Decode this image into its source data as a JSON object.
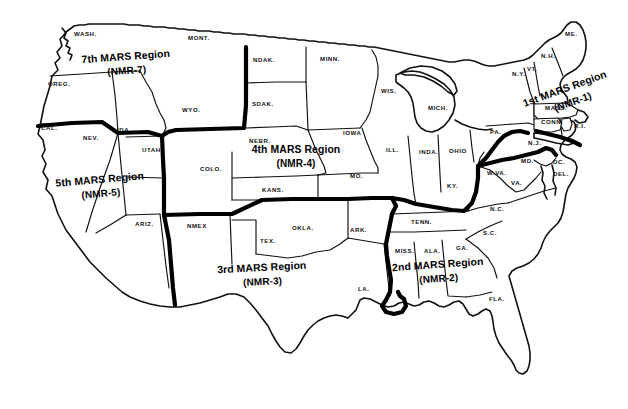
{
  "map": {
    "title": "MARS Region Map of the Continental United States",
    "background_color": "#ffffff",
    "line_color": "#111111",
    "region_boundary_color": "#000000",
    "regions": [
      {
        "id": "nmr-7",
        "name": "7th MARS Region",
        "code": "(NMR-7)",
        "label_x": 126,
        "label_y": 60,
        "sub_x": 126,
        "sub_y": 74
      },
      {
        "id": "nmr-5",
        "name": "5th MARS Region",
        "code": "(NMR-5)",
        "label_x": 100,
        "label_y": 183,
        "sub_x": 100,
        "sub_y": 197
      },
      {
        "id": "nmr-4",
        "name": "4th MARS Region",
        "code": "(NMR-4)",
        "label_x": 296,
        "label_y": 153,
        "sub_x": 296,
        "sub_y": 167
      },
      {
        "id": "nmr-3",
        "name": "3rd MARS Region",
        "code": "(NMR-3)",
        "label_x": 262,
        "label_y": 271,
        "sub_x": 262,
        "sub_y": 285
      },
      {
        "id": "nmr-2",
        "name": "2nd MARS Region",
        "code": "(NMR-2)",
        "label_x": 438,
        "label_y": 268,
        "sub_x": 438,
        "sub_y": 282
      },
      {
        "id": "nmr-1",
        "name": "1st MARS Region",
        "code": "(NMR-1)",
        "label_x": 566,
        "label_y": 92,
        "sub_x": 569,
        "sub_y": 107
      }
    ],
    "states": [
      {
        "abbr": "WASH.",
        "x": 74,
        "y": 36
      },
      {
        "abbr": "OREG.",
        "x": 48,
        "y": 86
      },
      {
        "abbr": "CAL.",
        "x": 41,
        "y": 130
      },
      {
        "abbr": "NEV.",
        "x": 83,
        "y": 140
      },
      {
        "abbr": "IDA.",
        "x": 117,
        "y": 132
      },
      {
        "abbr": "MONT.",
        "x": 188,
        "y": 40
      },
      {
        "abbr": "WYO.",
        "x": 182,
        "y": 112
      },
      {
        "abbr": "UTAH",
        "x": 142,
        "y": 152
      },
      {
        "abbr": "ARIZ.",
        "x": 135,
        "y": 226
      },
      {
        "abbr": "COLO.",
        "x": 200,
        "y": 171
      },
      {
        "abbr": "NMEX",
        "x": 187,
        "y": 228
      },
      {
        "abbr": "NDAK.",
        "x": 253,
        "y": 62
      },
      {
        "abbr": "SDAK.",
        "x": 252,
        "y": 106
      },
      {
        "abbr": "NEBR.",
        "x": 249,
        "y": 143
      },
      {
        "abbr": "KANS.",
        "x": 262,
        "y": 192
      },
      {
        "abbr": "OKLA.",
        "x": 292,
        "y": 230
      },
      {
        "abbr": "TEX.",
        "x": 260,
        "y": 243
      },
      {
        "abbr": "MINN.",
        "x": 320,
        "y": 61
      },
      {
        "abbr": "IOWA",
        "x": 343,
        "y": 135
      },
      {
        "abbr": "MO.",
        "x": 350,
        "y": 178
      },
      {
        "abbr": "ARK.",
        "x": 350,
        "y": 232
      },
      {
        "abbr": "LA.",
        "x": 358,
        "y": 291
      },
      {
        "abbr": "WIS.",
        "x": 381,
        "y": 93
      },
      {
        "abbr": "ILL.",
        "x": 386,
        "y": 152
      },
      {
        "abbr": "MICH.",
        "x": 428,
        "y": 110
      },
      {
        "abbr": "INDA.",
        "x": 419,
        "y": 154
      },
      {
        "abbr": "OHIO",
        "x": 449,
        "y": 153
      },
      {
        "abbr": "KY.",
        "x": 447,
        "y": 188
      },
      {
        "abbr": "TENN.",
        "x": 411,
        "y": 224
      },
      {
        "abbr": "MISS.",
        "x": 395,
        "y": 253
      },
      {
        "abbr": "ALA.",
        "x": 424,
        "y": 253
      },
      {
        "abbr": "GA.",
        "x": 456,
        "y": 250
      },
      {
        "abbr": "S.C.",
        "x": 483,
        "y": 235
      },
      {
        "abbr": "N.C.",
        "x": 490,
        "y": 211
      },
      {
        "abbr": "FLA.",
        "x": 489,
        "y": 301
      },
      {
        "abbr": "VA.",
        "x": 511,
        "y": 185
      },
      {
        "abbr": "W.VA.",
        "x": 487,
        "y": 175
      },
      {
        "abbr": "PA.",
        "x": 490,
        "y": 134
      },
      {
        "abbr": "N.J.",
        "x": 528,
        "y": 145
      },
      {
        "abbr": "MD.",
        "x": 521,
        "y": 163
      },
      {
        "abbr": "DC.",
        "x": 553,
        "y": 164
      },
      {
        "abbr": "DEL.",
        "x": 553,
        "y": 176
      },
      {
        "abbr": "N.Y.",
        "x": 512,
        "y": 76
      },
      {
        "abbr": "VT.",
        "x": 527,
        "y": 71
      },
      {
        "abbr": "N.H.",
        "x": 541,
        "y": 58
      },
      {
        "abbr": "ME.",
        "x": 565,
        "y": 36
      },
      {
        "abbr": "MASS.",
        "x": 545,
        "y": 110
      },
      {
        "abbr": "CONN.",
        "x": 541,
        "y": 124
      },
      {
        "abbr": "R.I.",
        "x": 574,
        "y": 128
      }
    ]
  }
}
